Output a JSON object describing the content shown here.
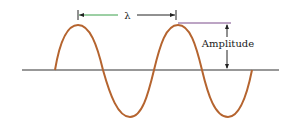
{
  "diagram": {
    "labels": {
      "wavelength": "λ",
      "amplitude": "Amplitude"
    },
    "colors": {
      "wave": "#b5642f",
      "axis": "#333333",
      "dimension_line": "#222222",
      "wavelength_accent": "#3aa04a",
      "amplitude_top_line": "#7a4a8a"
    },
    "geometry": {
      "baseline_y": 70,
      "axis_x": [
        22,
        279
      ],
      "wave_start_x": 55,
      "wave_end_x": 252,
      "peaks_x": [
        78,
        178
      ],
      "troughs_x": [
        130,
        228
      ],
      "crest_y": 25,
      "trough_y": 117
    }
  }
}
